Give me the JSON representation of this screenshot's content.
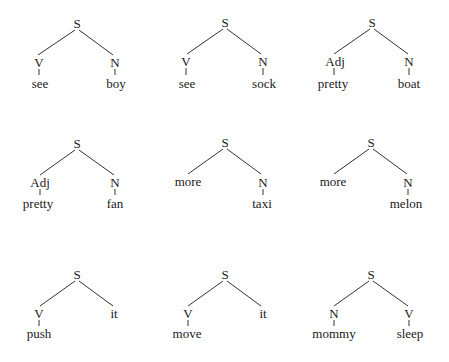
{
  "diagram": {
    "type": "syntax-tree-grid",
    "colors": {
      "text": "#1a1a1a",
      "line": "#333333",
      "background": "#ffffff"
    },
    "trees": [
      {
        "root": "S",
        "left": {
          "label": "V",
          "word": "see"
        },
        "right": {
          "label": "N",
          "word": "boy"
        }
      },
      {
        "root": "S",
        "left": {
          "label": "V",
          "word": "see"
        },
        "right": {
          "label": "N",
          "word": "sock"
        }
      },
      {
        "root": "S",
        "left": {
          "label": "Adj",
          "word": "pretty"
        },
        "right": {
          "label": "N",
          "word": "boat"
        }
      },
      {
        "root": "S",
        "left": {
          "label": "Adj",
          "word": "pretty"
        },
        "right": {
          "label": "N",
          "word": "fan"
        }
      },
      {
        "root": "S",
        "left": {
          "label": "more",
          "word": null
        },
        "right": {
          "label": "N",
          "word": "taxi"
        }
      },
      {
        "root": "S",
        "left": {
          "label": "more",
          "word": null
        },
        "right": {
          "label": "N",
          "word": "melon"
        }
      },
      {
        "root": "S",
        "left": {
          "label": "V",
          "word": "push"
        },
        "right": {
          "label": "it",
          "word": null
        }
      },
      {
        "root": "S",
        "left": {
          "label": "V",
          "word": "move"
        },
        "right": {
          "label": "it",
          "word": null
        }
      },
      {
        "root": "S",
        "left": {
          "label": "N",
          "word": "mommy"
        },
        "right": {
          "label": "V",
          "word": "sleep"
        }
      }
    ]
  }
}
